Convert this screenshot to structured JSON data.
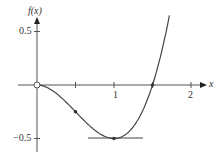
{
  "chart_data": {
    "type": "line",
    "title": "",
    "xlabel": "x",
    "ylabel": "f(x)",
    "function": "f(x) = x^3 - 1.5x^2",
    "x_ticks": [
      0.5,
      1,
      1.5,
      2
    ],
    "x_tick_labels": [
      "1",
      "2"
    ],
    "y_ticks": [
      0.5,
      -0.5
    ],
    "y_tick_labels": [
      "0.5",
      "-0.5"
    ],
    "xlim": [
      -0.3,
      2.2
    ],
    "ylim": [
      -0.6,
      0.65
    ],
    "series": [
      {
        "name": "f(x)",
        "x": [
          0,
          0.25,
          0.5,
          0.75,
          1,
          1.25,
          1.5,
          1.7
        ],
        "y": [
          0,
          -0.078,
          -0.25,
          -0.422,
          -0.5,
          -0.391,
          0,
          0.578
        ]
      }
    ],
    "marked_points": [
      {
        "x": 0,
        "y": 0,
        "style": "open circle"
      },
      {
        "x": 0.5,
        "y": -0.25,
        "style": "dot"
      },
      {
        "x": 1,
        "y": -0.5,
        "style": "dot"
      },
      {
        "x": 1.5,
        "y": 0,
        "style": "dot"
      }
    ],
    "annotations": [
      "horizontal tangent line at (1, -0.5)"
    ],
    "grid": false
  },
  "labels": {
    "y_axis": "f(x)",
    "x_axis": "x",
    "y_pos": "0.5",
    "y_neg": "−0.5",
    "x_one": "1",
    "x_two": "2"
  }
}
